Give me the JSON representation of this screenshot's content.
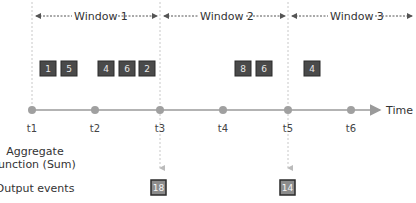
{
  "windows": [
    {
      "label": "Window 1"
    },
    {
      "label": "Window 2"
    },
    {
      "label": "Window 3"
    }
  ],
  "events": [
    {
      "value": "1"
    },
    {
      "value": "5"
    },
    {
      "value": "4"
    },
    {
      "value": "6"
    },
    {
      "value": "2"
    },
    {
      "value": "8"
    },
    {
      "value": "6"
    },
    {
      "value": "4"
    }
  ],
  "timeline": {
    "axis_label": "Time",
    "ticks": [
      "t1",
      "t2",
      "t3",
      "t4",
      "t5",
      "t6"
    ]
  },
  "rows": {
    "aggregate_line1": "Aggregate",
    "aggregate_line2": "function (Sum)",
    "output_label": "Output events"
  },
  "outputs": [
    {
      "value": "18"
    },
    {
      "value": "14"
    }
  ],
  "colors": {
    "event_box": "#4a4a4a",
    "output_box": "#8c8c8c",
    "axis": "#9a9a9a"
  }
}
